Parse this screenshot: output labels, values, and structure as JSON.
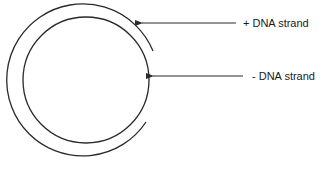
{
  "diagram": {
    "title": "",
    "stroke_color": "#2a2a2a",
    "labels": {
      "plus_strand": "+ DNA strand",
      "minus_strand": "- DNA strand"
    },
    "elements": [
      {
        "id": "outer-arc",
        "kind": "open circular arc",
        "represents": "+ DNA strand",
        "gap_side": "right"
      },
      {
        "id": "inner-circle",
        "kind": "closed circle",
        "represents": "- DNA strand"
      },
      {
        "id": "arrow-plus",
        "points_to": "outer-arc"
      },
      {
        "id": "arrow-minus",
        "points_to": "inner-circle"
      }
    ]
  }
}
